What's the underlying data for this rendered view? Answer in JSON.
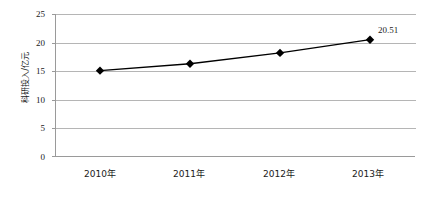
{
  "chart_data": {
    "type": "line",
    "title": "",
    "xlabel": "",
    "ylabel": "科研投入/亿元",
    "categories": [
      "2010年",
      "2011年",
      "2012年",
      "2013年"
    ],
    "values": [
      15.1,
      16.3,
      18.2,
      20.51
    ],
    "point_labels": [
      "",
      "",
      "",
      "20.51"
    ],
    "ylim": [
      0,
      25
    ],
    "yticks": [
      0,
      5,
      10,
      15,
      20,
      25
    ],
    "ytick_labels": [
      "0",
      "5",
      "10",
      "15",
      "20",
      "25"
    ],
    "grid": true,
    "legend": false,
    "series": [
      {
        "name": "科研投入",
        "values": [
          15.1,
          16.3,
          18.2,
          20.51
        ],
        "marker": "diamond",
        "line_color": "#000000",
        "marker_color": "#000000"
      }
    ],
    "colors": {
      "line": "#000000",
      "marker": "#000000",
      "gridline": "#b5b5b5",
      "axis": "#9a9a9a",
      "text": "#1a1a1a",
      "background": "#ffffff"
    }
  },
  "axis": {
    "y_title": "科研投入/亿元",
    "y_tick_0": "0",
    "y_tick_1": "5",
    "y_tick_2": "10",
    "y_tick_3": "15",
    "y_tick_4": "20",
    "y_tick_5": "25",
    "x_tick_0": "2010年",
    "x_tick_1": "2011年",
    "x_tick_2": "2012年",
    "x_tick_3": "2013年"
  },
  "annotations": {
    "last_point_value": "20.51"
  }
}
